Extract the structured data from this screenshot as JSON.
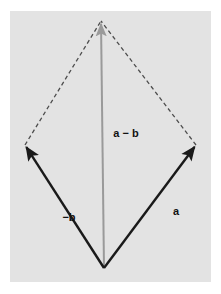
{
  "figure": {
    "canvas": {
      "width": 221,
      "height": 294
    },
    "panel": {
      "name": "plot-panel",
      "x": 10,
      "y": 11,
      "width": 201,
      "height": 271,
      "fill": "#e3e3e3"
    },
    "colors": {
      "background": "#ffffff",
      "panel": "#e3e3e3",
      "solid_vector": "#1a1a1a",
      "result_vector": "#9a9a9a",
      "dashed_guide": "#4d4d4d",
      "label_text": "#111111"
    }
  },
  "points": {
    "origin": {
      "name": "origin-vertex",
      "x": 104,
      "y": 268
    },
    "apex": {
      "name": "apex-vertex",
      "x": 101,
      "y": 21
    },
    "left": {
      "name": "left-vertex",
      "x": 25,
      "y": 145
    },
    "right": {
      "name": "right-vertex",
      "x": 196,
      "y": 145
    }
  },
  "vectors": [
    {
      "id": "minus-b",
      "label": "−b",
      "style": "solid",
      "color": "#1a1a1a",
      "width": 2.4,
      "from": "origin",
      "to": "left",
      "arrowhead": true,
      "label_x": 69,
      "label_y": 218
    },
    {
      "id": "a",
      "label": "a",
      "style": "solid",
      "color": "#1a1a1a",
      "width": 2.4,
      "from": "origin",
      "to": "right",
      "arrowhead": true,
      "label_x": 176,
      "label_y": 212
    },
    {
      "id": "a-minus-b",
      "label": "a − b",
      "style": "solid",
      "color": "#9a9a9a",
      "width": 2.0,
      "from": "origin",
      "to": "apex",
      "arrowhead": true,
      "label_x": 126,
      "label_y": 134
    }
  ],
  "guides": [
    {
      "id": "guide-left-apex",
      "style": "dashed",
      "color": "#4d4d4d",
      "width": 1.3,
      "dash": "4 3",
      "from": "left",
      "to": "apex"
    },
    {
      "id": "guide-right-apex",
      "style": "dashed",
      "color": "#4d4d4d",
      "width": 1.3,
      "dash": "4 3",
      "from": "right",
      "to": "apex"
    }
  ],
  "labels": {
    "minus_b": "−b",
    "a": "a",
    "a_minus_b": "a − b"
  }
}
